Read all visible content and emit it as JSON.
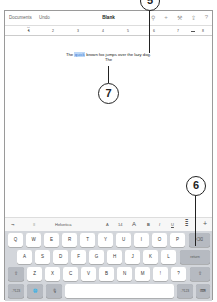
{
  "navbar": {
    "documents_label": "Documents",
    "undo_label": "Undo",
    "title": "Blank",
    "icons": [
      "search-icon",
      "plus-icon",
      "wrench-icon",
      "share-icon",
      "help-icon"
    ],
    "icon_glyphs": [
      "⚲",
      "+",
      "⚒",
      "⇪",
      "?"
    ]
  },
  "ruler": {
    "ticks": [
      "1",
      "2",
      "3",
      "4",
      "5",
      "6",
      "7",
      "8"
    ]
  },
  "document": {
    "text_before": "The ",
    "selected_word": "quick",
    "text_after": " brown fox jumps over the lazy dog.",
    "line2": "The"
  },
  "callouts": {
    "top": "5",
    "middle": "7",
    "right": "6"
  },
  "format_bar": {
    "tab_icon": "⇥",
    "indent_icon": "≡",
    "font_name": "Helvetica",
    "font_smaller": "A",
    "font_size": "14",
    "font_larger": "A",
    "bold": "B",
    "italic": "I",
    "underline": "U",
    "align_icon": "≣",
    "insert": "+"
  },
  "keyboard": {
    "row1": [
      "Q",
      "W",
      "E",
      "R",
      "T",
      "Y",
      "U",
      "I",
      "O",
      "P"
    ],
    "row2": [
      "A",
      "S",
      "D",
      "F",
      "G",
      "H",
      "J",
      "K",
      "L"
    ],
    "row3": [
      "Z",
      "X",
      "C",
      "V",
      "B",
      "N",
      "M",
      "!",
      "?"
    ],
    "delete_glyph": "⌫",
    "return_label": "return",
    "shift_glyph": "⇧",
    "numbers_label": ".?123",
    "globe_glyph": "🌐",
    "mic_glyph": "🎙",
    "hide_glyph": "⌨"
  }
}
